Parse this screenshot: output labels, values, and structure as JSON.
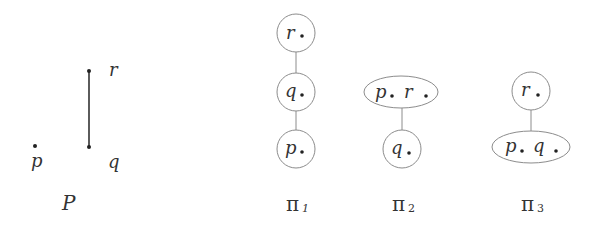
{
  "poset": {
    "name": "P",
    "elements": [
      {
        "label": "p",
        "x": 35,
        "y": 146
      },
      {
        "label": "q",
        "x": 89,
        "y": 147
      },
      {
        "label": "r",
        "x": 89,
        "y": 71
      }
    ],
    "relations": [
      [
        "q",
        "r"
      ]
    ]
  },
  "partitions": [
    {
      "name": "π",
      "subscript": "1",
      "blocks": [
        {
          "members": [
            "r"
          ],
          "label_text": "r"
        },
        {
          "members": [
            "q"
          ],
          "label_text": "q"
        },
        {
          "members": [
            "p"
          ],
          "label_text": "p"
        }
      ],
      "edges": [
        [
          "r",
          "q"
        ],
        [
          "q",
          "p"
        ]
      ]
    },
    {
      "name": "π",
      "subscript": "2",
      "blocks": [
        {
          "members": [
            "p",
            "r"
          ],
          "label_text_1": "p",
          "label_text_2": "r"
        },
        {
          "members": [
            "q"
          ],
          "label_text": "q"
        }
      ],
      "edges": [
        [
          "p r",
          "q"
        ]
      ]
    },
    {
      "name": "π",
      "subscript": "3",
      "blocks": [
        {
          "members": [
            "r"
          ],
          "label_text": "r"
        },
        {
          "members": [
            "p",
            "q"
          ],
          "label_text_1": "p",
          "label_text_2": "q"
        }
      ],
      "edges": [
        [
          "r",
          "p q"
        ]
      ]
    }
  ],
  "colors": {
    "node_stroke": "#8c8c8c",
    "text": "#333333",
    "background": "#ffffff"
  }
}
